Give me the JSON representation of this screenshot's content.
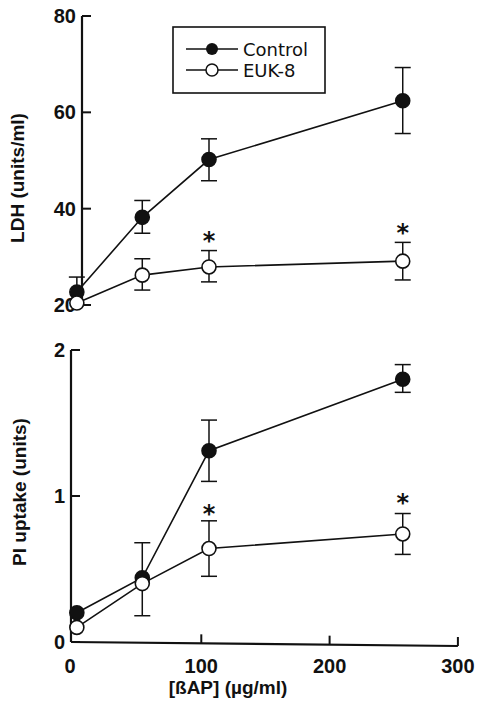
{
  "chart_data": [
    {
      "type": "line",
      "panel": "top",
      "title": "",
      "xlabel": "",
      "ylabel": "LDH (units/ml)",
      "ylim": [
        20,
        80
      ],
      "yticks": [
        20,
        40,
        60,
        80
      ],
      "xlim": [
        0,
        300
      ],
      "grid": false,
      "legend": {
        "position": "upper-center",
        "entries": [
          "Control",
          "EUK-8"
        ]
      },
      "x": [
        3,
        54,
        106,
        257
      ],
      "series": [
        {
          "name": "Control",
          "marker": "filled-circle",
          "values": [
            22.7,
            38.2,
            50.2,
            62.4
          ],
          "err_upper": [
            25.8,
            41.7,
            54.5,
            69.3
          ],
          "err_lower": [
            null,
            34.9,
            45.8,
            55.6
          ]
        },
        {
          "name": "EUK-8",
          "marker": "open-circle",
          "values": [
            20.4,
            26.2,
            27.9,
            29.1
          ],
          "err_upper": [
            null,
            29.6,
            31.3,
            33.0
          ],
          "err_lower": [
            null,
            23.1,
            24.8,
            25.2
          ]
        }
      ],
      "annotations": [
        {
          "text": "*",
          "x": 106,
          "y": 34.5
        },
        {
          "text": "*",
          "x": 257,
          "y": 36.2
        }
      ]
    },
    {
      "type": "line",
      "panel": "bottom",
      "title": "",
      "xlabel": "[ßAP]  (µg/ml)",
      "ylabel": "PI uptake (units)",
      "ylim": [
        0,
        2
      ],
      "yticks": [
        0,
        1,
        2
      ],
      "xlim": [
        0,
        300
      ],
      "xticks": [
        0,
        100,
        200,
        300
      ],
      "grid": false,
      "x": [
        3,
        54,
        106,
        257
      ],
      "series": [
        {
          "name": "Control",
          "marker": "filled-circle",
          "values": [
            0.2,
            0.44,
            1.31,
            1.8
          ],
          "err_upper": [
            null,
            null,
            1.52,
            1.9
          ],
          "err_lower": [
            null,
            null,
            1.1,
            1.71
          ]
        },
        {
          "name": "EUK-8",
          "marker": "open-circle",
          "values": [
            0.1,
            0.4,
            0.64,
            0.74
          ],
          "err_upper": [
            null,
            0.68,
            0.83,
            0.88
          ],
          "err_lower": [
            null,
            0.18,
            0.45,
            0.6
          ]
        }
      ],
      "annotations": [
        {
          "text": "*",
          "x": 106,
          "y": 0.92
        },
        {
          "text": "*",
          "x": 257,
          "y": 0.99
        }
      ]
    }
  ],
  "labels": {
    "top_ylabel": "LDH  (units/ml)",
    "bottom_ylabel": "PI  uptake  (units)",
    "xlabel": "[ßAP]  (µg/ml)",
    "legend_control": "Control",
    "legend_euk": "EUK-8",
    "top_ticks": [
      "80",
      "60",
      "40",
      "20"
    ],
    "bottom_ticks": [
      "2",
      "1",
      "0"
    ],
    "x_ticks": [
      "0",
      "100",
      "200",
      "300"
    ],
    "star": "*"
  }
}
